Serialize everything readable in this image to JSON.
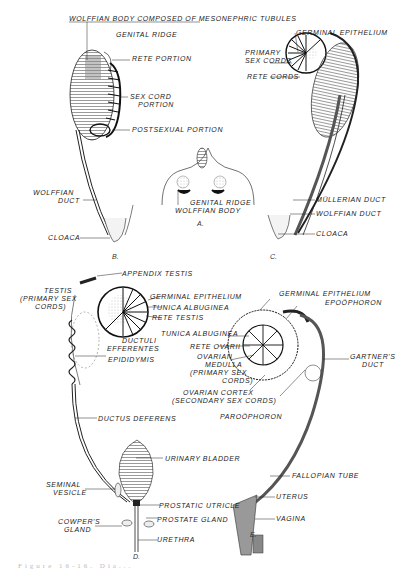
{
  "figures": {
    "A": {
      "letter": "A.",
      "labels": {
        "genital_ridge": "GENITAL RIDGE",
        "wolffian_body": "WOLFFIAN BODY"
      }
    },
    "B": {
      "letter": "B.",
      "labels": {
        "wolffian_body": "WOLFFIAN BODY COMPOSED OF MESONEPHRIC TUBULES",
        "genital_ridge": "GENITAL RIDGE",
        "rete_portion": "RETE PORTION",
        "sex_cord_1": "SEX CORD",
        "sex_cord_2": "PORTION",
        "postsexual": "POSTSEXUAL PORTION",
        "wolffian_duct_1": "WOLFFIAN",
        "wolffian_duct_2": "DUCT",
        "cloaca": "CLOACA"
      }
    },
    "C": {
      "letter": "C.",
      "labels": {
        "germinal_epithelium": "GERMINAL EPITHELIUM",
        "primary_sex_cords_1": "PRIMARY",
        "primary_sex_cords_2": "SEX CORDS",
        "rete_cords": "RETE CORDS",
        "mullerian_duct": "MÜLLERIAN DUCT",
        "wolffian_duct": "WOLFFIAN DUCT",
        "cloaca": "CLOACA"
      }
    },
    "D": {
      "letter": "D.",
      "labels": {
        "appendix_testis": "APPENDIX TESTIS",
        "testis_1": "TESTIS",
        "testis_2": "(PRIMARY SEX",
        "testis_3": "CORDS)",
        "germinal_epithelium": "GERMINAL EPITHELIUM",
        "tunica_albuginea": "TUNICA ALBUGINEA",
        "rete_testis": "RETE TESTIS",
        "ductuli_1": "DUCTULI",
        "ductuli_2": "EFFERENTES",
        "epididymis": "EPIDIDYMIS",
        "ductus_deferens": "DUCTUS DEFERENS",
        "urinary_bladder": "URINARY BLADDER",
        "seminal_1": "SEMINAL",
        "seminal_2": "VESICLE",
        "prostatic_utricle": "PROSTATIC UTRICLE",
        "prostate_gland": "PROSTATE GLAND",
        "cowpers_1": "COWPER'S",
        "cowpers_2": "GLAND",
        "urethra": "URETHRA"
      }
    },
    "E": {
      "letter": "E.",
      "labels": {
        "germinal_epithelium": "GERMINAL EPITHELIUM",
        "epoophoron": "EPOÖPHORON",
        "tunica_albuginea": "TUNICA ALBUGINEA",
        "rete_ovarii": "RETE OVARII",
        "medulla_1": "OVARIAN",
        "medulla_2": "MEDULLA",
        "medulla_3": "(PRIMARY SEX",
        "medulla_4": "CORDS)",
        "cortex_1": "OVARIAN CORTEX",
        "cortex_2": "(SECONDARY SEX CORDS)",
        "gartners_1": "GARTNER'S",
        "gartners_2": "DUCT",
        "paroophoron": "PAROÖPHORON",
        "fallopian_tube": "FALLOPIAN TUBE",
        "uterus": "UTERUS",
        "vagina": "VAGINA"
      }
    }
  },
  "caption": "Figure 16-16. Dia..."
}
